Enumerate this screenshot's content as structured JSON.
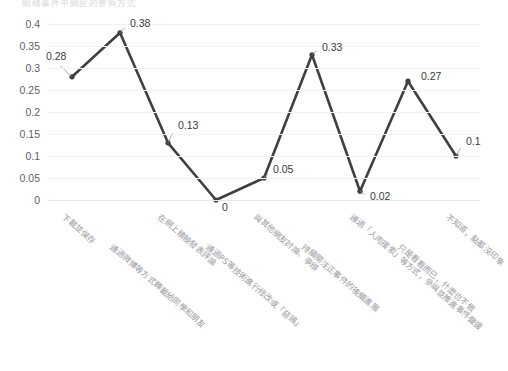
{
  "chart_data": {
    "type": "line",
    "title": "網絡事件中網民的參與方式",
    "categories": [
      "下載並保存",
      "通過微博等方式轉載給同學和朋友",
      "在網上積極發表評論",
      "通過PS等技術進行修改或「惡搞」",
      "與其他網友討論、爭辯",
      "持續關注正事件的後續進展",
      "通過「人肉搜索」等方式，參與並推進事件聲援",
      "只是看看而已，什麼也不做",
      "不知道，點都沒印象"
    ],
    "values": [
      0.28,
      0.38,
      0.13,
      0,
      0.05,
      0.33,
      0.02,
      0.27,
      0.1
    ],
    "point_labels": [
      "0.28",
      "0.38",
      "0.13",
      "0",
      "0.05",
      "0.33",
      "0.02",
      "0.27",
      "0.1"
    ],
    "yticks": [
      "0.4",
      "0.35",
      "0.3",
      "0.25",
      "0.2",
      "0.15",
      "0.1",
      "0.05",
      "0"
    ],
    "ytick_values": [
      0.4,
      0.35,
      0.3,
      0.25,
      0.2,
      0.15,
      0.1,
      0.05,
      0
    ],
    "ylim": [
      0,
      0.4
    ],
    "xlabel": "",
    "ylabel": "",
    "grid": true,
    "legend": false,
    "series_color": "#3f3f44",
    "grid_color": "#f1f1f4",
    "label_color": "#9a9aa2"
  }
}
